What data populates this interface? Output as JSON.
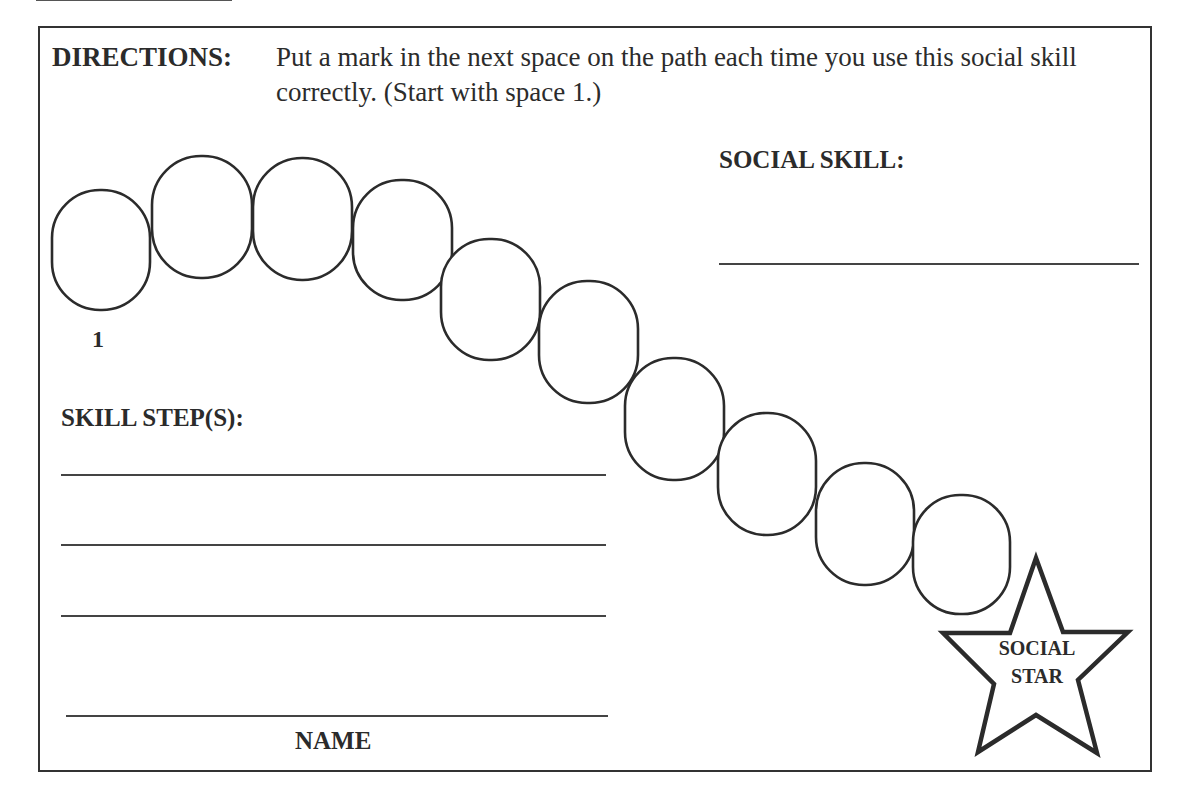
{
  "directions": {
    "label": "DIRECTIONS:",
    "text": "Put a mark in the next space on the path each time you use this social skill correctly. (Start with space 1.)"
  },
  "social_skill": {
    "label": "SOCIAL SKILL:",
    "value": ""
  },
  "skill_steps": {
    "label": "SKILL STEP(S):",
    "lines": [
      "",
      "",
      ""
    ]
  },
  "name": {
    "label": "NAME",
    "value": ""
  },
  "path": {
    "space_count": 10,
    "start_label": "1",
    "spaces": [
      {
        "index": 1,
        "marked": false
      },
      {
        "index": 2,
        "marked": false
      },
      {
        "index": 3,
        "marked": false
      },
      {
        "index": 4,
        "marked": false
      },
      {
        "index": 5,
        "marked": false
      },
      {
        "index": 6,
        "marked": false
      },
      {
        "index": 7,
        "marked": false
      },
      {
        "index": 8,
        "marked": false
      },
      {
        "index": 9,
        "marked": false
      },
      {
        "index": 10,
        "marked": false
      }
    ]
  },
  "goal": {
    "icon": "star-icon",
    "line1": "SOCIAL",
    "line2": "STAR"
  },
  "colors": {
    "ink": "#2b2b2b",
    "paper": "#ffffff"
  }
}
